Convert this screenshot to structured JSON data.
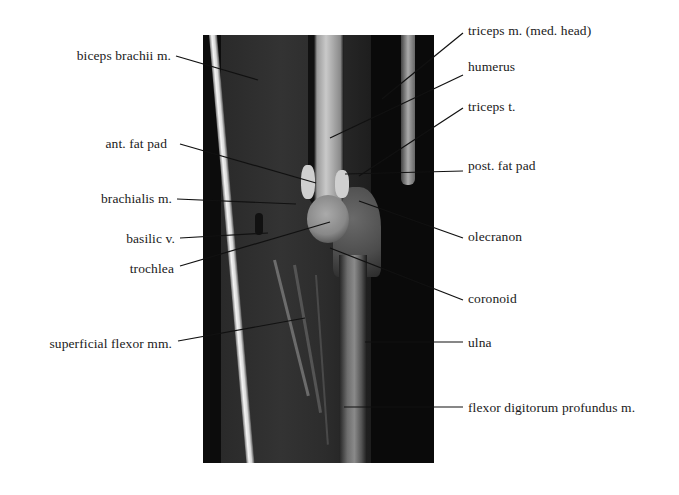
{
  "figure": {
    "type": "labeled MRI (sagittal elbow)",
    "image_bounds": {
      "x": 203,
      "y": 35,
      "width": 231,
      "height": 428
    }
  },
  "labels": {
    "left": [
      {
        "text": "biceps brachii m.",
        "x_right": 171,
        "y": 48,
        "line": [
          176,
          56,
          258,
          80
        ]
      },
      {
        "text": "ant. fat pad",
        "x_right": 167,
        "y": 136,
        "line": [
          180,
          144,
          316,
          183
        ]
      },
      {
        "text": "brachialis m.",
        "x_right": 172,
        "y": 191,
        "line": [
          177,
          199,
          296,
          204
        ]
      },
      {
        "text": "basilic v.",
        "x_right": 175,
        "y": 231,
        "line": [
          180,
          238,
          268,
          233
        ]
      },
      {
        "text": "trochlea",
        "x_right": 174,
        "y": 261,
        "line": [
          180,
          266,
          330,
          222
        ]
      },
      {
        "text": "superficial flexor mm.",
        "x_right": 172,
        "y": 336,
        "line": [
          178,
          341,
          305,
          318
        ]
      }
    ],
    "right": [
      {
        "text": "triceps m. (med. head)",
        "x_left": 468,
        "y": 23,
        "line": [
          463,
          33,
          382,
          99
        ]
      },
      {
        "text": "humerus",
        "x_left": 468,
        "y": 59,
        "line": [
          463,
          75,
          330,
          138
        ]
      },
      {
        "text": "triceps t.",
        "x_left": 468,
        "y": 99,
        "line": [
          463,
          108,
          359,
          176
        ]
      },
      {
        "text": "post. fat pad",
        "x_left": 468,
        "y": 158,
        "line": [
          463,
          171,
          345,
          174
        ]
      },
      {
        "text": "olecranon",
        "x_left": 468,
        "y": 229,
        "line": [
          463,
          238,
          359,
          201
        ]
      },
      {
        "text": "coronoid",
        "x_left": 468,
        "y": 291,
        "line": [
          463,
          300,
          330,
          248
        ]
      },
      {
        "text": "ulna",
        "x_left": 468,
        "y": 335,
        "line": [
          463,
          342,
          365,
          342
        ]
      },
      {
        "text": "flexor digitorum profundus m.",
        "x_left": 468,
        "y": 400,
        "line": [
          463,
          407,
          344,
          407
        ]
      }
    ]
  }
}
